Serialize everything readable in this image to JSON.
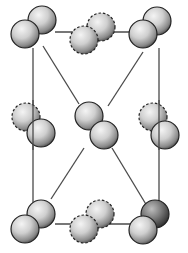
{
  "diagram": {
    "type": "crystal-structure",
    "colors": {
      "background": "#ffffff",
      "line": "#4a4a4a",
      "sphere_light": "#f2f2f2",
      "sphere_mid": "#b5b5b5",
      "sphere_dark": "#3a3a3a",
      "outline": "#222222"
    },
    "edges": [
      {
        "x1": 33,
        "y1": 48,
        "x2": 33,
        "y2": 208
      },
      {
        "x1": 159,
        "y1": 48,
        "x2": 159,
        "y2": 208
      },
      {
        "x1": 55,
        "y1": 32,
        "x2": 135,
        "y2": 32
      },
      {
        "x1": 55,
        "y1": 224,
        "x2": 135,
        "y2": 224
      },
      {
        "x1": 43,
        "y1": 46,
        "x2": 79,
        "y2": 104
      },
      {
        "x1": 143,
        "y1": 52,
        "x2": 108,
        "y2": 106
      },
      {
        "x1": 84,
        "y1": 148,
        "x2": 51,
        "y2": 199
      },
      {
        "x1": 112,
        "y1": 148,
        "x2": 147,
        "y2": 206
      }
    ],
    "molecules": [
      {
        "name": "corner-top-left",
        "atoms": [
          {
            "cx": 42,
            "cy": 20,
            "r": 14,
            "dashed": false
          },
          {
            "cx": 25,
            "cy": 34,
            "r": 14,
            "dashed": false
          }
        ]
      },
      {
        "name": "edge-top-middle",
        "atoms": [
          {
            "cx": 101,
            "cy": 27,
            "r": 14,
            "dashed": true
          },
          {
            "cx": 84,
            "cy": 40,
            "r": 14,
            "dashed": true
          }
        ]
      },
      {
        "name": "corner-top-right",
        "atoms": [
          {
            "cx": 157,
            "cy": 21,
            "r": 14,
            "dashed": false
          },
          {
            "cx": 143,
            "cy": 34,
            "r": 14,
            "dashed": false
          }
        ]
      },
      {
        "name": "edge-middle-left",
        "atoms": [
          {
            "cx": 26,
            "cy": 117,
            "r": 14,
            "dashed": true
          },
          {
            "cx": 41,
            "cy": 133,
            "r": 14,
            "dashed": false
          }
        ]
      },
      {
        "name": "body-center",
        "atoms": [
          {
            "cx": 89,
            "cy": 116,
            "r": 14,
            "dashed": false
          },
          {
            "cx": 104,
            "cy": 135,
            "r": 14,
            "dashed": false
          }
        ]
      },
      {
        "name": "edge-middle-right",
        "atoms": [
          {
            "cx": 153,
            "cy": 117,
            "r": 14,
            "dashed": true
          },
          {
            "cx": 165,
            "cy": 135,
            "r": 14,
            "dashed": false
          }
        ]
      },
      {
        "name": "corner-bottom-left",
        "atoms": [
          {
            "cx": 41,
            "cy": 214,
            "r": 14,
            "dashed": false
          },
          {
            "cx": 25,
            "cy": 229,
            "r": 14,
            "dashed": false
          }
        ]
      },
      {
        "name": "edge-bottom-middle",
        "atoms": [
          {
            "cx": 100,
            "cy": 214,
            "r": 14,
            "dashed": true
          },
          {
            "cx": 84,
            "cy": 229,
            "r": 14,
            "dashed": true
          }
        ]
      },
      {
        "name": "corner-bottom-right",
        "atoms": [
          {
            "cx": 155,
            "cy": 214,
            "r": 14,
            "dashed": false,
            "dark": true
          },
          {
            "cx": 143,
            "cy": 230,
            "r": 14,
            "dashed": false
          }
        ]
      }
    ]
  }
}
